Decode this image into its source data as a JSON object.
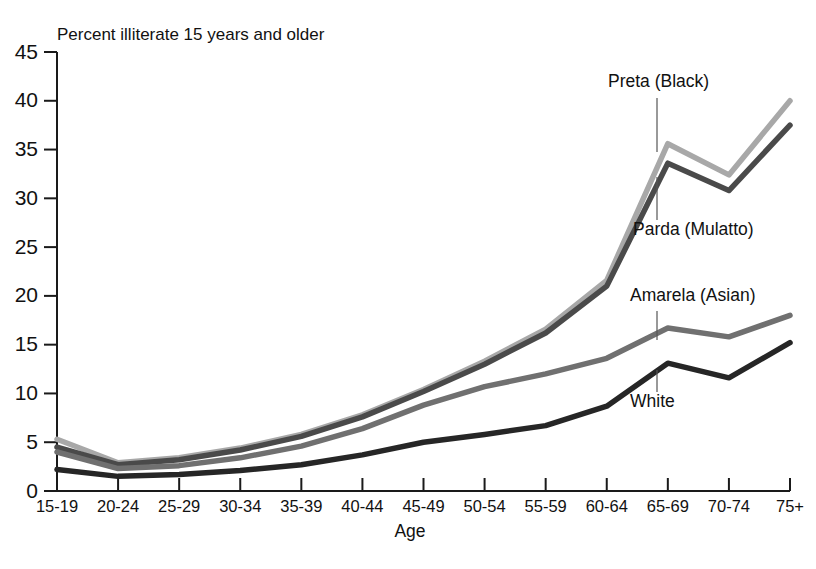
{
  "chart_data": {
    "type": "line",
    "title": "Percent illiterate 15 years and older",
    "xlabel": "Age",
    "ylabel": "",
    "ylim": [
      0,
      45
    ],
    "yticks": [
      0,
      5,
      10,
      15,
      20,
      25,
      30,
      35,
      40,
      45
    ],
    "grid": false,
    "legend_position": "inline-annotations",
    "categories": [
      "15-19",
      "20-24",
      "25-29",
      "30-34",
      "35-39",
      "40-44",
      "45-49",
      "50-54",
      "55-59",
      "60-64",
      "65-69",
      "70-74",
      "75+"
    ],
    "series": [
      {
        "name": "Preta (Black)",
        "color": "#a8a8a8",
        "values": [
          5.3,
          2.9,
          3.4,
          4.4,
          5.8,
          7.8,
          10.4,
          13.3,
          16.6,
          21.6,
          35.6,
          32.4,
          40.0
        ]
      },
      {
        "name": "Parda (Mulatto)",
        "color": "#4a4a4a",
        "values": [
          4.5,
          2.7,
          3.2,
          4.2,
          5.6,
          7.6,
          10.2,
          13.0,
          16.2,
          21.0,
          33.6,
          30.8,
          37.5
        ]
      },
      {
        "name": "Amarela (Asian)",
        "color": "#707070",
        "values": [
          4.0,
          2.3,
          2.6,
          3.4,
          4.6,
          6.4,
          8.8,
          10.7,
          12.0,
          13.6,
          16.7,
          15.8,
          18.0
        ]
      },
      {
        "name": "White",
        "color": "#262626",
        "values": [
          2.2,
          1.5,
          1.7,
          2.1,
          2.7,
          3.7,
          5.0,
          5.8,
          6.7,
          8.7,
          13.1,
          11.6,
          15.2
        ]
      }
    ],
    "annotations": [
      {
        "text": "Preta (Black)",
        "series": "Preta (Black)",
        "label_x": 608,
        "label_y": 74,
        "leader_x": 657,
        "leader_y1": 98,
        "leader_y2": 152
      },
      {
        "text": "Parda (Mulatto)",
        "series": "Parda (Mulatto)",
        "label_x": 633,
        "label_y": 222,
        "leader_x": 657,
        "leader_y1": 220,
        "leader_y2": 177
      },
      {
        "text": "Amarela (Asian)",
        "series": "Amarela (Asian)",
        "label_x": 630,
        "label_y": 288,
        "leader_x": 657,
        "leader_y1": 311,
        "leader_y2": 340
      },
      {
        "text": "White",
        "series": "White",
        "label_x": 630,
        "label_y": 394,
        "leader_x": 657,
        "leader_y1": 392,
        "leader_y2": 370
      }
    ]
  }
}
